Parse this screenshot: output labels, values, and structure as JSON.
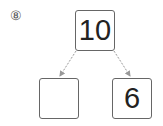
{
  "problem": {
    "number_label": "⑧",
    "top_value": "10",
    "bottom_left_value": "",
    "bottom_right_value": "6"
  },
  "colors": {
    "box_border": "#666666",
    "arrow": "#999999",
    "text": "#222222"
  }
}
